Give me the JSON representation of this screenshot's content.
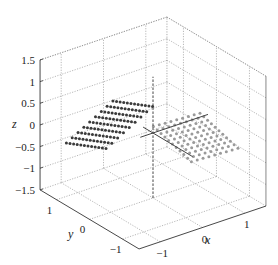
{
  "chart_data": {
    "type": "scatter",
    "dimensions": 3,
    "title": "",
    "xlabel": "x",
    "ylabel": "y",
    "zlabel": "z",
    "xlim": [
      -1.5,
      1.5
    ],
    "ylim": [
      -1.5,
      1.5
    ],
    "zlim": [
      -1.5,
      1.5
    ],
    "xticks": [
      -1,
      0,
      1
    ],
    "yticks": [
      -1,
      0,
      1
    ],
    "zticks": [
      -1.5,
      -1,
      -0.5,
      0,
      0.5,
      1,
      1.5
    ],
    "xtick_labels": [
      "−1",
      "0",
      "1"
    ],
    "ytick_labels": [
      "−1",
      "0",
      "1"
    ],
    "ztick_labels": [
      "−1.5",
      "−1",
      "−0.5",
      "0",
      "0.5",
      "1",
      "1.5"
    ],
    "grid": true,
    "grid_style": "dotted",
    "center_axes": true,
    "series": [
      {
        "name": "plane-dark",
        "color": "#3a3a3a",
        "x_range": [
          -1,
          0
        ],
        "y_range": [
          -1,
          1
        ],
        "z_expr": "planar sheet tilted, z from about -0.9 to 0.4",
        "grid_n": [
          9,
          12
        ]
      },
      {
        "name": "plane-light",
        "color": "#9a9a9a",
        "x_range": [
          0,
          1
        ],
        "y_range": [
          -1,
          1
        ],
        "z_expr": "planar sheet, z near 0 to -0.4",
        "grid_n": [
          9,
          12
        ]
      }
    ],
    "legend": null
  }
}
